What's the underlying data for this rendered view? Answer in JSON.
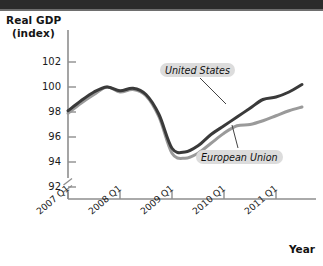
{
  "chart_data": {
    "type": "line",
    "title": "",
    "ylabel": "Real GDP (index)",
    "xlabel": "Year",
    "ylim": [
      91,
      103
    ],
    "yticks": [
      92,
      94,
      96,
      98,
      100,
      102
    ],
    "axis_break": true,
    "grid": false,
    "legend_position": "inline-annotation",
    "xtick_labels": [
      "2007 Q1",
      "2008 Q1",
      "2009 Q1",
      "2010 Q1",
      "2011 Q1"
    ],
    "x": [
      "2007 Q1",
      "2007 Q2",
      "2007 Q3",
      "2007 Q4",
      "2008 Q1",
      "2008 Q2",
      "2008 Q3",
      "2008 Q4",
      "2009 Q1",
      "2009 Q2",
      "2009 Q3",
      "2009 Q4",
      "2010 Q1",
      "2010 Q2",
      "2010 Q3",
      "2010 Q4",
      "2011 Q1",
      "2011 Q2",
      "2011 Q3"
    ],
    "series": [
      {
        "name": "United States",
        "color": "#3a3a3a",
        "values": [
          98.1,
          98.9,
          99.6,
          100.0,
          99.7,
          99.9,
          99.4,
          97.8,
          95.1,
          94.8,
          95.3,
          96.2,
          96.9,
          97.6,
          98.3,
          99.0,
          99.2,
          99.6,
          100.2
        ]
      },
      {
        "name": "European Union",
        "color": "#9a9a9a",
        "values": [
          97.9,
          98.7,
          99.4,
          100.0,
          99.6,
          99.8,
          99.3,
          97.6,
          94.7,
          94.3,
          94.7,
          95.5,
          96.3,
          96.9,
          97.0,
          97.3,
          97.7,
          98.1,
          98.4
        ]
      }
    ],
    "annotations": [
      {
        "text": "United States",
        "target_series": "United States"
      },
      {
        "text": "European Union",
        "target_series": "European Union"
      }
    ]
  },
  "axis": {
    "y_label_line1": "Real GDP",
    "y_label_line2": "(index)",
    "x_title": "Year",
    "y_tick_102": "102",
    "y_tick_100": "100",
    "y_tick_98": "98",
    "y_tick_96": "96",
    "y_tick_94": "94",
    "y_tick_92": "92",
    "x_tick_1": "2007 Q1",
    "x_tick_2": "2008 Q1",
    "x_tick_3": "2009 Q1",
    "x_tick_4": "2010 Q1",
    "x_tick_5": "2011 Q1"
  },
  "labels": {
    "united_states": "United States",
    "european_union": "European Union"
  },
  "colors": {
    "united_states_line": "#3a3a3a",
    "european_union_line": "#9a9a9a",
    "axis": "#8e8e8e",
    "text": "#1a1a1a",
    "label_bg": "#dcdcdc"
  }
}
